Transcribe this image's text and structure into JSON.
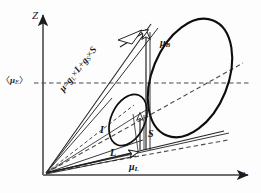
{
  "figure": {
    "background_color": "#fdfdfd",
    "line_color": "#1c1c1c",
    "axes": {
      "vertical_label": "Z",
      "horizontal_label": "x"
    },
    "equation": {
      "mu": "μ",
      "equals": "=",
      "g_symbol": "g",
      "sub_L": "L",
      "sub_S": "S",
      "times": "×",
      "plus": "+",
      "vec_L": "L",
      "vec_S": "S",
      "full_text": "μ=g_L×L+g_S×S"
    },
    "labels": {
      "mu_B": {
        "symbol": "μ",
        "subscript": "B"
      },
      "mu_L": {
        "symbol": "μ",
        "subscript": "L"
      },
      "mean_mu_E": {
        "open": "〈",
        "symbol": "μ",
        "subscript": "E",
        "close": "〉"
      },
      "vector_I": "I",
      "vector_S": "S",
      "vector_L": "L"
    }
  }
}
